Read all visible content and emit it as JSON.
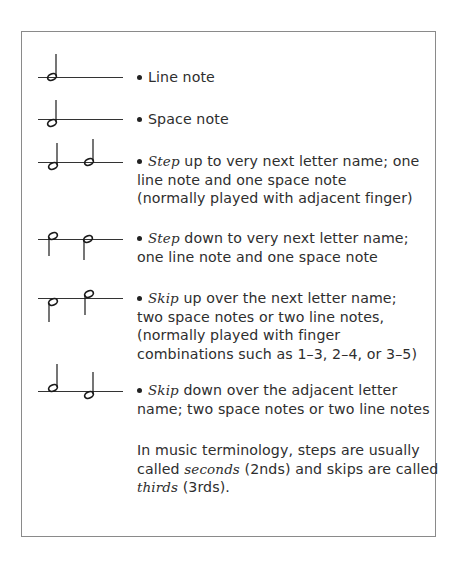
{
  "items": [
    {
      "notation": "line-note",
      "lines": [
        {
          "parts": [
            {
              "text": "Line note"
            }
          ]
        }
      ]
    },
    {
      "notation": "space-note",
      "lines": [
        {
          "parts": [
            {
              "text": "Space note"
            }
          ]
        }
      ]
    },
    {
      "notation": "step-up",
      "lines": [
        {
          "parts": [
            {
              "text": "Step",
              "italic": true
            },
            {
              "text": " up to very next letter name; one"
            }
          ]
        },
        {
          "parts": [
            {
              "text": "line note and one space note"
            }
          ]
        },
        {
          "parts": [
            {
              "text": "(normally played with adjacent finger)"
            }
          ]
        }
      ]
    },
    {
      "notation": "step-down",
      "lines": [
        {
          "parts": [
            {
              "text": "Step",
              "italic": true
            },
            {
              "text": " down to very next letter name;"
            }
          ]
        },
        {
          "parts": [
            {
              "text": "one line note and one space note"
            }
          ]
        }
      ]
    },
    {
      "notation": "skip-up",
      "lines": [
        {
          "parts": [
            {
              "text": "Skip",
              "italic": true
            },
            {
              "text": " up over the next letter name;"
            }
          ]
        },
        {
          "parts": [
            {
              "text": "two space notes or two line notes,"
            }
          ]
        },
        {
          "parts": [
            {
              "text": "(normally played with finger"
            }
          ]
        },
        {
          "parts": [
            {
              "text": "combinations such as 1–3, 2–4, or 3–5)"
            }
          ]
        }
      ]
    },
    {
      "notation": "skip-down",
      "lines": [
        {
          "parts": [
            {
              "text": "Skip",
              "italic": true
            },
            {
              "text": " down over the adjacent letter"
            }
          ]
        },
        {
          "parts": [
            {
              "text": "name; two space notes or two line notes"
            }
          ]
        }
      ]
    }
  ],
  "note": {
    "line1": {
      "a": "In music terminology, steps are usually"
    },
    "line2": {
      "a": "called ",
      "b": "seconds",
      "c": " (2nds) and skips are called"
    },
    "line3": {
      "a": "thirds",
      "b": " (3rds)."
    }
  },
  "colors": {
    "text": "#2e2e2e",
    "border": "#8a8a8a",
    "ink": "#1a1a1a"
  }
}
